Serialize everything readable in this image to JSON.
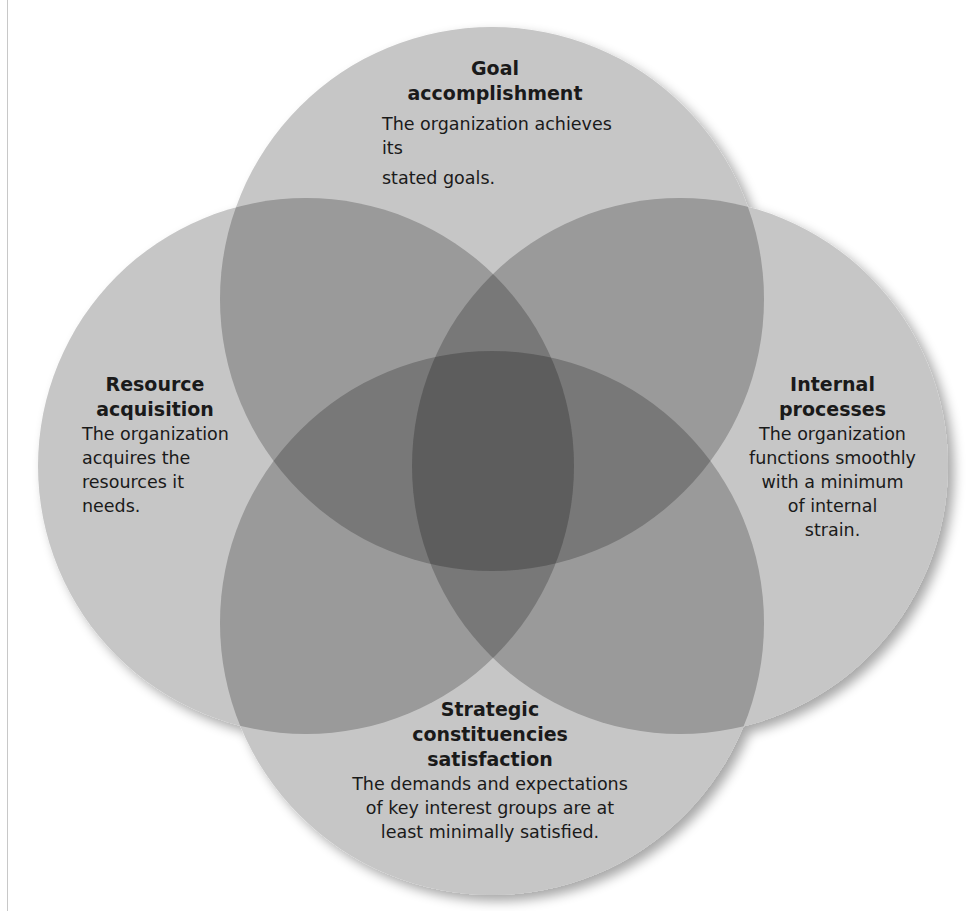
{
  "diagram": {
    "type": "four-circle venn",
    "colors": {
      "single_overlap": "#c6c6c6",
      "double_overlap": "#9a9a9a",
      "center": "#555555",
      "text": "#1a1a1a"
    },
    "circles": [
      {
        "id": "goal",
        "title_line1": "Goal",
        "title_line2": "accomplishment",
        "desc_line1": "The organization achieves its",
        "desc_line2": "stated goals."
      },
      {
        "id": "resource",
        "title_line1": "Resource",
        "title_line2": "acquisition",
        "desc_line1": "The organization",
        "desc_line2": "acquires the",
        "desc_line3": "resources it",
        "desc_line4": "needs."
      },
      {
        "id": "internal",
        "title_line1": "Internal",
        "title_line2": "processes",
        "desc_line1": "The organization",
        "desc_line2": "functions smoothly",
        "desc_line3": "with a minimum",
        "desc_line4": "of internal",
        "desc_line5": "strain."
      },
      {
        "id": "strategic",
        "title_line1": "Strategic",
        "title_line2": "constituencies",
        "title_line3": "satisfaction",
        "desc_line1": "The demands and expectations",
        "desc_line2": "of key interest groups are at",
        "desc_line3": "least minimally satisfied."
      }
    ]
  }
}
